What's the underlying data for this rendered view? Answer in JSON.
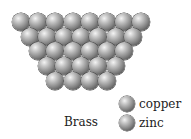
{
  "diagram": {
    "title": "Brass",
    "lattice": {
      "rows": [
        8,
        7,
        6,
        5,
        4
      ],
      "sphere_diameter": 18,
      "x_spacing": 17.2,
      "y_spacing": 14.7,
      "origin_x": 12,
      "origin_y": 13
    },
    "legend": [
      {
        "label": "copper",
        "icon": "copper-atom-sphere"
      },
      {
        "label": "zinc",
        "icon": "zinc-atom-sphere"
      }
    ]
  }
}
